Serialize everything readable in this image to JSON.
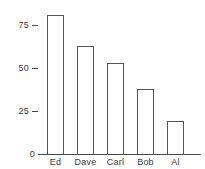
{
  "chart_data": {
    "type": "bar",
    "title": "",
    "subtitle": "",
    "xlabel": "",
    "ylabel": "",
    "categories": [
      "Ed",
      "Dave",
      "Carl",
      "Bob",
      "Al"
    ],
    "values": [
      81,
      63,
      53,
      38,
      19
    ],
    "ylim": [
      0,
      85
    ],
    "yticks": [
      0,
      25,
      50,
      75
    ],
    "ytick_labels": [
      "0",
      "25",
      "50",
      "75"
    ],
    "grid": false,
    "legend": false,
    "legend_position": "none",
    "bar_fill_color": "#ffffff",
    "bar_edge_color": "#555555",
    "axis_color": "#4a4a4a",
    "text_color": "#3a3a3a",
    "background_color": "#ffffff"
  }
}
